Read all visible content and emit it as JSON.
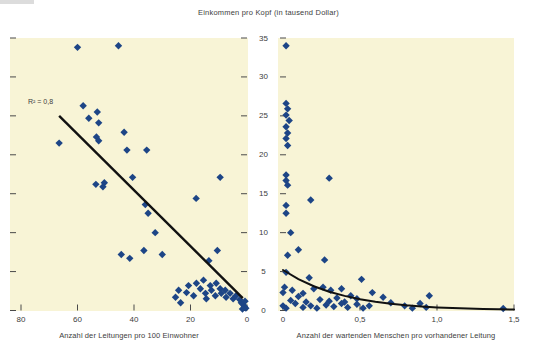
{
  "title": "Einkommen pro Kopf (in tausend Dollar)",
  "colors": {
    "page_bg": "#ffffff",
    "plot_bg": "#f8f4d6",
    "marker": "#1d4586",
    "trend": "#111111",
    "axis": "#4a4a4a",
    "text": "#3d3d3d"
  },
  "y_axis": {
    "min": 0,
    "max": 35,
    "ticks": [
      0,
      5,
      10,
      15,
      20,
      25,
      30,
      35
    ],
    "tick_labels": [
      "0",
      "5",
      "10",
      "15",
      "20",
      "25",
      "30",
      "35"
    ]
  },
  "chart_data": [
    {
      "id": "left",
      "type": "scatter",
      "xlabel": "Anzahl der Leitungen pro 100 Einwohner",
      "xlim": [
        80,
        0
      ],
      "ylim": [
        0,
        35
      ],
      "x_axis_reversed": true,
      "grid": false,
      "x_ticks": [
        80,
        60,
        40,
        20,
        0
      ],
      "x_tick_labels": [
        "80",
        "60",
        "40",
        "20",
        "0"
      ],
      "annotation": "R² = 0,8",
      "trendline": {
        "type": "linear",
        "from": [
          66.5,
          25.0
        ],
        "to": [
          1.5,
          1.6
        ]
      },
      "points": [
        [
          60,
          33.8
        ],
        [
          45.5,
          34.0
        ],
        [
          58,
          26.3
        ],
        [
          53,
          25.5
        ],
        [
          56,
          24.7
        ],
        [
          52.5,
          24.1
        ],
        [
          43.5,
          22.9
        ],
        [
          53.3,
          22.3
        ],
        [
          52.5,
          21.8
        ],
        [
          66.5,
          21.5
        ],
        [
          42.5,
          20.6
        ],
        [
          35.5,
          20.6
        ],
        [
          53.5,
          16.2
        ],
        [
          50.5,
          16.4
        ],
        [
          51,
          15.9
        ],
        [
          40.5,
          17.1
        ],
        [
          9.5,
          17.1
        ],
        [
          18,
          14.4
        ],
        [
          36,
          13.6
        ],
        [
          35,
          12.5
        ],
        [
          32.5,
          10.0
        ],
        [
          44.5,
          7.2
        ],
        [
          41.5,
          6.7
        ],
        [
          36.5,
          7.7
        ],
        [
          30,
          7.2
        ],
        [
          13.5,
          6.4
        ],
        [
          10.5,
          7.7
        ],
        [
          25.3,
          1.7
        ],
        [
          24.2,
          2.6
        ],
        [
          23.5,
          1.0
        ],
        [
          21.4,
          2.3
        ],
        [
          20.7,
          3.2
        ],
        [
          18.9,
          1.9
        ],
        [
          17.9,
          3.5
        ],
        [
          16.5,
          2.8
        ],
        [
          15.4,
          3.9
        ],
        [
          14.7,
          2.2
        ],
        [
          14.4,
          1.5
        ],
        [
          13,
          3.2
        ],
        [
          12.6,
          2.6
        ],
        [
          11.2,
          1.9
        ],
        [
          10.9,
          3.5
        ],
        [
          9.5,
          2.8
        ],
        [
          9.1,
          2.2
        ],
        [
          7.7,
          2.6
        ],
        [
          7.4,
          1.7
        ],
        [
          6,
          2.2
        ],
        [
          4.9,
          1.5
        ],
        [
          3.9,
          1.9
        ],
        [
          2.6,
          1.4
        ],
        [
          2.0,
          1.0
        ],
        [
          1.4,
          0.8
        ],
        [
          0.9,
          0.5
        ],
        [
          0.4,
          0.3
        ],
        [
          1.6,
          0.2
        ],
        [
          0.7,
          1.2
        ]
      ]
    },
    {
      "id": "right",
      "type": "scatter",
      "xlabel": "Anzahl der wartenden Menschen pro vorhandener Leitung",
      "xlim": [
        0,
        1.5
      ],
      "ylim": [
        0,
        35
      ],
      "grid": false,
      "x_ticks": [
        0,
        0.5,
        1.0,
        1.5
      ],
      "x_tick_labels": [
        "0",
        "0,5",
        "1,0",
        "1,5"
      ],
      "trendline": {
        "type": "curve",
        "points": [
          [
            0,
            5.2
          ],
          [
            0.1,
            4.03
          ],
          [
            0.2,
            3.12
          ],
          [
            0.3,
            2.42
          ],
          [
            0.4,
            1.87
          ],
          [
            0.5,
            1.45
          ],
          [
            0.6,
            1.12
          ],
          [
            0.7,
            0.87
          ],
          [
            0.8,
            0.67
          ],
          [
            0.9,
            0.52
          ],
          [
            1.0,
            0.4
          ],
          [
            1.1,
            0.31
          ],
          [
            1.2,
            0.24
          ],
          [
            1.3,
            0.19
          ],
          [
            1.4,
            0.15
          ],
          [
            1.5,
            0.11
          ]
        ]
      },
      "points": [
        [
          0.02,
          34.0
        ],
        [
          0.02,
          26.6
        ],
        [
          0.03,
          25.9
        ],
        [
          0.02,
          25.1
        ],
        [
          0.04,
          24.4
        ],
        [
          0.02,
          23.6
        ],
        [
          0.03,
          22.8
        ],
        [
          0.02,
          22.1
        ],
        [
          0.03,
          21.2
        ],
        [
          0.02,
          17.4
        ],
        [
          0.02,
          16.7
        ],
        [
          0.03,
          16.1
        ],
        [
          0.3,
          17.0
        ],
        [
          0.18,
          14.2
        ],
        [
          0.02,
          13.5
        ],
        [
          0.02,
          12.5
        ],
        [
          0.05,
          10.0
        ],
        [
          0.03,
          7.1
        ],
        [
          0.1,
          7.8
        ],
        [
          0.27,
          6.5
        ],
        [
          0.02,
          4.9
        ],
        [
          0.17,
          4.2
        ],
        [
          0.51,
          4.0
        ],
        [
          0.01,
          3.0
        ],
        [
          0.06,
          2.6
        ],
        [
          0.0,
          2.3
        ],
        [
          0.13,
          2.2
        ],
        [
          0.2,
          2.8
        ],
        [
          0.26,
          3.0
        ],
        [
          0.31,
          2.6
        ],
        [
          0.38,
          2.8
        ],
        [
          0.44,
          1.9
        ],
        [
          0.48,
          1.5
        ],
        [
          0.58,
          2.3
        ],
        [
          0.65,
          1.7
        ],
        [
          0.7,
          1.0
        ],
        [
          0.05,
          1.3
        ],
        [
          0.1,
          1.8
        ],
        [
          0.15,
          1.1
        ],
        [
          0.24,
          1.4
        ],
        [
          0.3,
          1.2
        ],
        [
          0.35,
          1.6
        ],
        [
          0.4,
          1.1
        ],
        [
          0.0,
          0.6
        ],
        [
          0.02,
          0.3
        ],
        [
          0.08,
          0.9
        ],
        [
          0.13,
          0.4
        ],
        [
          0.18,
          0.6
        ],
        [
          0.22,
          0.3
        ],
        [
          0.28,
          0.7
        ],
        [
          0.33,
          0.5
        ],
        [
          0.38,
          0.9
        ],
        [
          0.42,
          0.4
        ],
        [
          0.48,
          0.8
        ],
        [
          0.52,
          0.3
        ],
        [
          0.56,
          0.6
        ],
        [
          0.79,
          0.6
        ],
        [
          0.84,
          0.3
        ],
        [
          0.89,
          0.9
        ],
        [
          0.93,
          0.4
        ],
        [
          0.95,
          1.9
        ],
        [
          1.43,
          0.25
        ]
      ]
    }
  ]
}
